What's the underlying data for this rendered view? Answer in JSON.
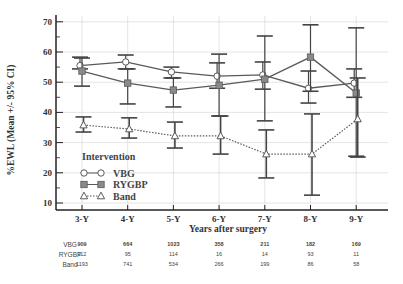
{
  "chart_data": {
    "type": "line",
    "title": "",
    "xlabel": "Years after surgery",
    "ylabel": "%EWL (Mean +/- 95% CI)",
    "ylim": [
      10,
      70
    ],
    "yticks": [
      10,
      20,
      30,
      40,
      50,
      60,
      70
    ],
    "grid": true,
    "categories": [
      "3-Y",
      "4-Y",
      "5-Y",
      "6-Y",
      "7-Y",
      "8-Y",
      "9-Y"
    ],
    "legend": {
      "title": "Intervention",
      "position": "lower-left inside"
    },
    "series": [
      {
        "name": "VBG",
        "marker": "circle-open",
        "line": "solid",
        "values": [
          55.5,
          56.7,
          53.4,
          52.0,
          52.4,
          48.0,
          49.7
        ],
        "ci_low": [
          54.4,
          54.4,
          51.4,
          48.0,
          47.7,
          43.1,
          45.0
        ],
        "ci_high": [
          58.3,
          59.0,
          55.0,
          56.4,
          56.7,
          53.7,
          54.4
        ]
      },
      {
        "name": "RYGBP",
        "marker": "square-filled",
        "line": "solid",
        "values": [
          53.7,
          49.7,
          47.4,
          49.0,
          51.0,
          58.3,
          46.4
        ],
        "ci_low": [
          48.7,
          42.8,
          41.8,
          38.8,
          37.2,
          47.0,
          25.5
        ],
        "ci_high": [
          58.0,
          54.4,
          51.4,
          59.3,
          65.3,
          69.0,
          68.0
        ]
      },
      {
        "name": "Band",
        "marker": "triangle-open",
        "line": "dotted",
        "values": [
          35.8,
          34.5,
          32.2,
          32.2,
          26.2,
          26.2,
          37.8
        ],
        "ci_low": [
          33.5,
          31.5,
          28.2,
          26.2,
          18.3,
          12.6,
          25.2
        ],
        "ci_high": [
          38.5,
          38.2,
          36.8,
          38.8,
          34.2,
          39.5,
          51.4
        ]
      }
    ]
  },
  "table": {
    "rows": [
      {
        "label": "VBG",
        "values": [
          "909",
          "664",
          "1023",
          "358",
          "211",
          "182",
          "169"
        ]
      },
      {
        "label": "RYGBP",
        "values": [
          "112",
          "95",
          "114",
          "16",
          "14",
          "93",
          "11"
        ]
      },
      {
        "label": "Band",
        "values": [
          "1193",
          "741",
          "534",
          "266",
          "199",
          "86",
          "58"
        ]
      }
    ]
  },
  "colors": {
    "line": "#5a5a5a",
    "marker_fill": "#8a8a8a",
    "ci": "#444444",
    "grid": "#dddddd",
    "axis": "#222222"
  }
}
